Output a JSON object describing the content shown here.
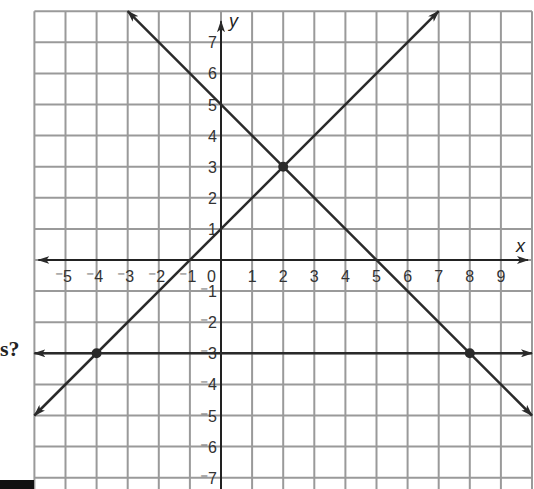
{
  "chart_data": {
    "type": "line",
    "title": "",
    "xlabel": "x",
    "ylabel": "y",
    "xlim": [
      -6,
      10
    ],
    "ylim": [
      -7.4,
      8
    ],
    "grid": true,
    "x_ticks": [
      "-5",
      "-4",
      "-3",
      "-2",
      "-1",
      "0",
      "1",
      "2",
      "3",
      "4",
      "5",
      "6",
      "7",
      "8",
      "9"
    ],
    "y_ticks": [
      "7",
      "6",
      "5",
      "4",
      "3",
      "2",
      "1",
      "-1",
      "-2",
      "-3",
      "-4",
      "-5",
      "-6",
      "-7"
    ],
    "series": [
      {
        "name": "line-1",
        "equation": "y = x + 1",
        "from": [
          -6,
          -5
        ],
        "to": [
          7,
          8
        ],
        "arrows": "both"
      },
      {
        "name": "line-2",
        "equation": "y = -x + 5",
        "from": [
          -3,
          8
        ],
        "to": [
          10,
          -5
        ],
        "arrows": "both"
      },
      {
        "name": "line-3",
        "equation": "y = -3",
        "from": [
          -6,
          -3
        ],
        "to": [
          10,
          -3
        ],
        "arrows": "both"
      }
    ],
    "points": [
      {
        "label": "intersection-1-2",
        "x": 2,
        "y": 3
      },
      {
        "label": "intersection-1-3",
        "x": -4,
        "y": -3
      },
      {
        "label": "intersection-2-3",
        "x": 8,
        "y": -3
      }
    ]
  },
  "page": {
    "question_fragment": "s?"
  },
  "colors": {
    "grid": "#9a9a9a",
    "axis": "#222222",
    "line": "#2a2a2a"
  }
}
